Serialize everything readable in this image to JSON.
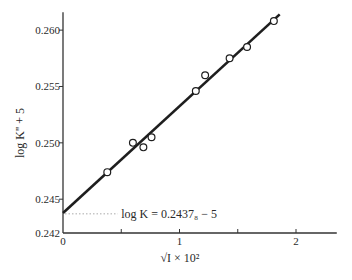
{
  "chart_data": {
    "type": "scatter",
    "title": "",
    "xlabel": "√I × 10²",
    "ylabel": "log K'' + 5",
    "xlim": [
      0,
      2.35
    ],
    "ylim": [
      0.242,
      0.2615
    ],
    "x_ticks": [
      0,
      0.5,
      1,
      1.5,
      2
    ],
    "x_tick_labels": [
      "0",
      "",
      "1",
      "",
      "2"
    ],
    "y_ticks": [
      0.242,
      0.245,
      0.25,
      0.255,
      0.26
    ],
    "y_tick_labels": [
      "0.242",
      "0.245",
      "0.250",
      "0.255",
      "0.260"
    ],
    "grid": false,
    "legend": null,
    "series": [
      {
        "name": "measured",
        "marker": "open-circle",
        "points": [
          {
            "x": 0.38,
            "y": 0.2474
          },
          {
            "x": 0.6,
            "y": 0.25
          },
          {
            "x": 0.69,
            "y": 0.2496
          },
          {
            "x": 0.76,
            "y": 0.2505
          },
          {
            "x": 1.14,
            "y": 0.2546
          },
          {
            "x": 1.22,
            "y": 0.256
          },
          {
            "x": 1.43,
            "y": 0.2575
          },
          {
            "x": 1.58,
            "y": 0.2585
          },
          {
            "x": 1.81,
            "y": 0.2608
          }
        ]
      },
      {
        "name": "fit line",
        "type": "line",
        "points": [
          {
            "x": 0,
            "y": 0.24378
          },
          {
            "x": 1.86,
            "y": 0.2614
          }
        ]
      }
    ],
    "annotations": [
      {
        "text": "log K = 0.2437₈ − 5",
        "x": 0.6,
        "y": 0.2437,
        "dotted_leader_from_x": 0
      }
    ]
  },
  "labels": {
    "xlabel": "√I × 10²",
    "ylabel": "log K'' + 5",
    "annotation": "log K = 0.2437₈ − 5"
  }
}
